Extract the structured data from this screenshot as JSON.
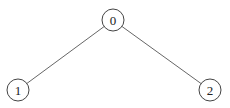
{
  "diagram": {
    "type": "tree",
    "nodes": [
      {
        "id": "0",
        "label": "0",
        "x": 113,
        "y": 20,
        "r": 11
      },
      {
        "id": "1",
        "label": "1",
        "x": 18,
        "y": 90,
        "r": 11
      },
      {
        "id": "2",
        "label": "2",
        "x": 210,
        "y": 90,
        "r": 11
      }
    ],
    "edges": [
      {
        "from": "0",
        "to": "1"
      },
      {
        "from": "0",
        "to": "2"
      }
    ]
  }
}
